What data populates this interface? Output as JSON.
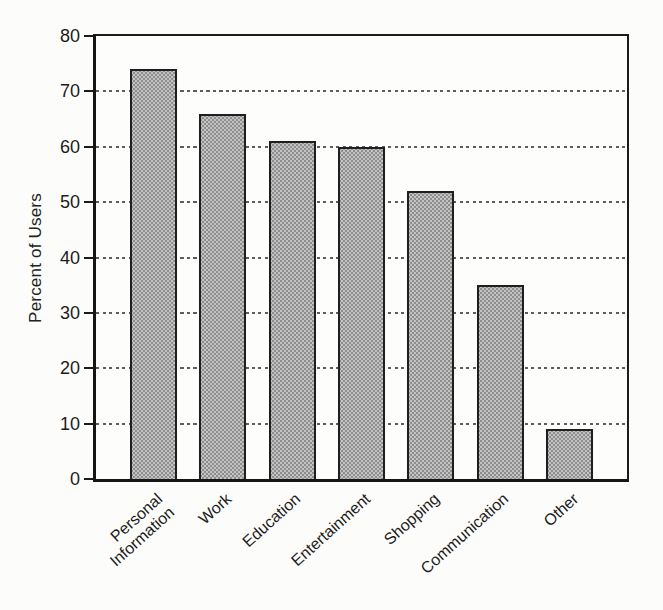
{
  "figure": {
    "background": "#fcfcfa",
    "bar_fill": "#c3c3c3",
    "bar_stipple": "#8e8e8e",
    "bar_border": "#1f1f1f",
    "axis_color": "#151515",
    "gridline_color": "#4c4c4c",
    "text_color": "#1c1c1c"
  },
  "chart_data": {
    "type": "bar",
    "title": "",
    "xlabel": "",
    "ylabel": "Percent of Users",
    "categories": [
      "Personal\nInformation",
      "Work",
      "Education",
      "Entertainment",
      "Shopping",
      "Communication",
      "Other"
    ],
    "values": [
      74,
      66,
      61,
      60,
      52,
      35,
      9
    ],
    "ylim": [
      0,
      80
    ],
    "yticks": [
      0,
      10,
      20,
      30,
      40,
      50,
      60,
      70,
      80
    ],
    "grid": "horizontal-dotted",
    "legend": "none",
    "bar_texture": "gray-halftone-stipple",
    "x_label_rotation_deg": -42
  }
}
